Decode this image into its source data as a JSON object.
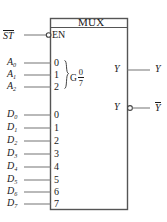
{
  "diagram": {
    "type": "logic-symbol",
    "title": "MUX",
    "enable": {
      "external_label": "ST",
      "external_label_overbar": true,
      "internal_label": "EN",
      "active_low_bubble": true
    },
    "select_group": {
      "qualifier": "G",
      "range_top": "0",
      "range_bottom": "7",
      "brace": true,
      "inputs": [
        {
          "signal": "A",
          "subscript": "0",
          "pin": "0"
        },
        {
          "signal": "A",
          "subscript": "1",
          "pin": "1"
        },
        {
          "signal": "A",
          "subscript": "2",
          "pin": "2"
        }
      ]
    },
    "data_inputs": [
      {
        "signal": "D",
        "subscript": "0",
        "pin": "0"
      },
      {
        "signal": "D",
        "subscript": "1",
        "pin": "1"
      },
      {
        "signal": "D",
        "subscript": "2",
        "pin": "2"
      },
      {
        "signal": "D",
        "subscript": "3",
        "pin": "3"
      },
      {
        "signal": "D",
        "subscript": "4",
        "pin": "4"
      },
      {
        "signal": "D",
        "subscript": "5",
        "pin": "5"
      },
      {
        "signal": "D",
        "subscript": "6",
        "pin": "6"
      },
      {
        "signal": "D",
        "subscript": "7",
        "pin": "7"
      }
    ],
    "outputs": [
      {
        "internal_label": "Y",
        "external_label": "Y",
        "external_label_overbar": false,
        "inverting_bubble": false
      },
      {
        "internal_label": "Y",
        "external_label": "Y",
        "external_label_overbar": true,
        "inverting_bubble": true
      }
    ],
    "colors": {
      "ink": "#1a1a1a",
      "wire": "#808080",
      "background": "#ffffff"
    }
  }
}
